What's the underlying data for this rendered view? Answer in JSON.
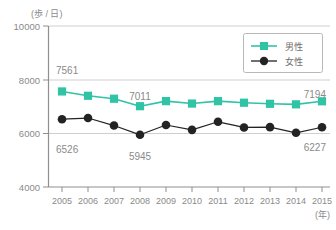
{
  "chart_data": {
    "type": "line",
    "title": "",
    "xlabel": "(年)",
    "ylabel": "(歩 / 日)",
    "x": [
      2005,
      2006,
      2007,
      2008,
      2009,
      2010,
      2011,
      2012,
      2013,
      2014,
      2015
    ],
    "categories": [
      "2005",
      "2006",
      "2007",
      "2008",
      "2009",
      "2010",
      "2011",
      "2012",
      "2013",
      "2014",
      "2015"
    ],
    "ylim": [
      4000,
      10000
    ],
    "yticks": [
      4000,
      6000,
      8000,
      10000
    ],
    "ytick_labels": [
      "4000",
      "6000",
      "8000",
      "10000"
    ],
    "grid": true,
    "legend_position": "top-right",
    "series": [
      {
        "name": "男性",
        "color": "#31c3a6",
        "marker": "square",
        "values": [
          7561,
          7400,
          7290,
          7011,
          7200,
          7110,
          7200,
          7140,
          7100,
          7080,
          7194
        ]
      },
      {
        "name": "女性",
        "color": "#232323",
        "marker": "circle",
        "values": [
          6526,
          6570,
          6290,
          5945,
          6310,
          6130,
          6430,
          6220,
          6230,
          6020,
          6227
        ]
      }
    ],
    "annotations": [
      {
        "text": "7561",
        "series": "男性",
        "x": 2005,
        "value": 7561,
        "position": "above-left"
      },
      {
        "text": "7011",
        "series": "男性",
        "x": 2008,
        "value": 7011,
        "position": "above"
      },
      {
        "text": "7194",
        "series": "男性",
        "x": 2015,
        "value": 7194,
        "position": "above-right"
      },
      {
        "text": "6526",
        "series": "女性",
        "x": 2005,
        "value": 6526,
        "position": "below-left"
      },
      {
        "text": "5945",
        "series": "女性",
        "x": 2008,
        "value": 5945,
        "position": "below"
      },
      {
        "text": "6227",
        "series": "女性",
        "x": 2015,
        "value": 6227,
        "position": "below-right"
      }
    ]
  },
  "axes": {
    "y_unit": "(歩 / 日)",
    "x_unit": "(年)",
    "y_tick_10000": "10000",
    "y_tick_8000": "8000",
    "y_tick_6000": "6000",
    "y_tick_4000": "4000"
  },
  "xticks": {
    "t0": "2005",
    "t1": "2006",
    "t2": "2007",
    "t3": "2008",
    "t4": "2009",
    "t5": "2010",
    "t6": "2011",
    "t7": "2012",
    "t8": "2013",
    "t9": "2014",
    "t10": "2015"
  },
  "labels": {
    "male_first": "7561",
    "male_mid": "7011",
    "male_last": "7194",
    "female_first": "6526",
    "female_mid": "5945",
    "female_last": "6227"
  },
  "legend": {
    "male": "男性",
    "female": "女性"
  },
  "colors": {
    "male": "#31c3a6",
    "female": "#232323",
    "grid": "#cfcfcf",
    "axis": "#8f8f8f",
    "text": "#8a8a8a"
  }
}
